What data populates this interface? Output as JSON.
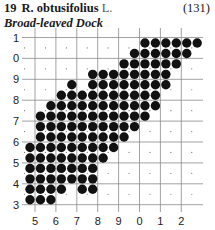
{
  "header": {
    "number": "19",
    "species": "R. obtusifolius",
    "author": "L.",
    "page_ref": "(131)",
    "common_name": "Broad-leaved Dock"
  },
  "map": {
    "type": "tetrad distribution dot map",
    "y_labels": [
      "1",
      "0",
      "9",
      "8",
      "7",
      "6",
      "5",
      "4",
      "3"
    ],
    "x_labels": [
      "5",
      "6",
      "7",
      "8",
      "9",
      "0",
      "1",
      "2"
    ],
    "dot_color": "#111111",
    "grid_color": "#8a8a8a",
    "occupied_rows": [
      {
        "row": 0,
        "cols": [
          11,
          12,
          13,
          14,
          15,
          16
        ]
      },
      {
        "row": 1,
        "cols": [
          10,
          11,
          12,
          13,
          14,
          15
        ]
      },
      {
        "row": 2,
        "cols": [
          9,
          10,
          11,
          12,
          13,
          14
        ]
      },
      {
        "row": 3,
        "cols": [
          6,
          7,
          8,
          9,
          10,
          11,
          12,
          13
        ]
      },
      {
        "row": 4,
        "cols": [
          4,
          6,
          7,
          8,
          9,
          10,
          11,
          12,
          13
        ]
      },
      {
        "row": 5,
        "cols": [
          3,
          4,
          5,
          6,
          7,
          8,
          9,
          10,
          11,
          12
        ]
      },
      {
        "row": 6,
        "cols": [
          2,
          3,
          4,
          5,
          6,
          7,
          8,
          9,
          10,
          11,
          12
        ]
      },
      {
        "row": 7,
        "cols": [
          1,
          2,
          3,
          4,
          5,
          6,
          7,
          8,
          9,
          10,
          11
        ]
      },
      {
        "row": 8,
        "cols": [
          1,
          2,
          3,
          4,
          5,
          6,
          7,
          8,
          9,
          10
        ]
      },
      {
        "row": 9,
        "cols": [
          1,
          2,
          3,
          4,
          5,
          6,
          7,
          8,
          9
        ]
      },
      {
        "row": 10,
        "cols": [
          0,
          1,
          2,
          3,
          4,
          5,
          6,
          7,
          8
        ]
      },
      {
        "row": 11,
        "cols": [
          0,
          1,
          2,
          3,
          4,
          5,
          6,
          7
        ]
      },
      {
        "row": 12,
        "cols": [
          0,
          1,
          2,
          3,
          4,
          5,
          6
        ]
      },
      {
        "row": 13,
        "cols": [
          0,
          1,
          2,
          3,
          4,
          5,
          6
        ]
      },
      {
        "row": 14,
        "cols": [
          0,
          1,
          2,
          3,
          5,
          6
        ]
      },
      {
        "row": 15,
        "cols": [
          0,
          1,
          2
        ]
      }
    ]
  }
}
